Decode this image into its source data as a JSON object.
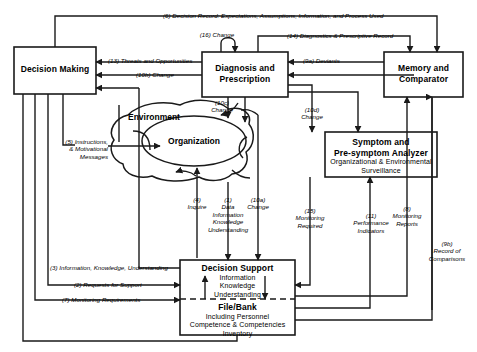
{
  "diagram": {
    "type": "flow-diagram",
    "nodes": [
      {
        "id": "decision-making",
        "label": "Decision Making"
      },
      {
        "id": "diagnosis-prescription",
        "label_line1": "Diagnosis and",
        "label_line2": "Prescription"
      },
      {
        "id": "memory-comparator",
        "label_line1": "Memory and",
        "label_line2": "Comparator"
      },
      {
        "id": "symptom-analyzer",
        "label_line1": "Symptom and",
        "label_line2": "Pre-symptom Analyzer",
        "sub_line1": "Organizational & Environmental",
        "sub_line2": "Surveillance"
      },
      {
        "id": "decision-support",
        "label": "Decision Support",
        "sub_line1": "Information",
        "sub_line2": "Knowledge",
        "sub_line3": "Understanding"
      },
      {
        "id": "file-bank",
        "label": "File/Bank",
        "sub_line1": "Including Personnel",
        "sub_line2": "Competence & Competencies",
        "sub_line3": "Inventory"
      },
      {
        "id": "environment",
        "label": "Environment"
      },
      {
        "id": "organization",
        "label": "Organization"
      }
    ],
    "edges": [
      {
        "id": "e6",
        "label": "(6) Decision Record: Expectations, Assumptions, Information, and Process Used"
      },
      {
        "id": "e16",
        "label": "(16) Change"
      },
      {
        "id": "e14",
        "label": "(14) Diagnostics & Prescriptive Record"
      },
      {
        "id": "e13",
        "label": "(13) Threats and Opportunities"
      },
      {
        "id": "e10b",
        "label": "(10b) Change"
      },
      {
        "id": "e9a",
        "label": "(9a) Deviants"
      },
      {
        "id": "e10c",
        "label_line1": "(10c)",
        "label_line2": "Change"
      },
      {
        "id": "e10d",
        "label_line1": "(10d)",
        "label_line2": "Change"
      },
      {
        "id": "e5",
        "label_line1": "(5) Instructions,",
        "label_line2": "& Motivational",
        "label_line3": "Messages"
      },
      {
        "id": "e4",
        "label_line1": "(4)",
        "label_line2": "Inquire"
      },
      {
        "id": "e1",
        "label_line1": "(1)",
        "label_line2": "Data",
        "label_line3": "Information",
        "label_line4": "Knowledge",
        "label_line5": "Understanding"
      },
      {
        "id": "e10a",
        "label_line1": "(10a)",
        "label_line2": "Change"
      },
      {
        "id": "e15",
        "label_line1": "(15)",
        "label_line2": "Monitoring",
        "label_line3": "Required"
      },
      {
        "id": "e11",
        "label_line1": "(11)",
        "label_line2": "Performance",
        "label_line3": "Indicators"
      },
      {
        "id": "e8",
        "label_line1": "(8)",
        "label_line2": "Monitoring",
        "label_line3": "Reports"
      },
      {
        "id": "e9b",
        "label_line1": "(9b)",
        "label_line2": "Record of",
        "label_line3": "Comparisons"
      },
      {
        "id": "e3",
        "label": "(3) Information, Knowledge, Understanding"
      },
      {
        "id": "e2",
        "label": "(2) Requests for Support"
      },
      {
        "id": "e7",
        "label": "(7) Monitoring Requirements"
      }
    ],
    "colors": {
      "stroke": "#1a1a1a",
      "fill": "#ffffff",
      "text": "#000000"
    }
  }
}
